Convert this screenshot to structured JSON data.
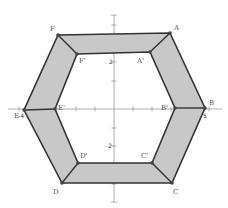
{
  "diagram": {
    "type": "geometry-figure",
    "colors": {
      "band_fill": "#c8c8c8",
      "edge": "#333333",
      "axis": "#9a9a9a",
      "label": "#555555"
    },
    "outer_hexagon": {
      "vertices": [
        {
          "name": "A",
          "label": "A",
          "x": 170,
          "y": 33,
          "lx": 174,
          "ly": 30
        },
        {
          "name": "B",
          "label": "B",
          "x": 205,
          "y": 108,
          "lx": 209,
          "ly": 105
        },
        {
          "name": "C",
          "label": "C",
          "x": 172,
          "y": 183,
          "lx": 173,
          "ly": 194
        },
        {
          "name": "D",
          "label": "D",
          "x": 62,
          "y": 183,
          "lx": 53,
          "ly": 194
        },
        {
          "name": "E",
          "label": "E",
          "x": 24,
          "y": 110,
          "lx": 14,
          "ly": 118
        },
        {
          "name": "F",
          "label": "F",
          "x": 58,
          "y": 35,
          "lx": 50,
          "ly": 31
        }
      ]
    },
    "inner_hexagon": {
      "vertices": [
        {
          "name": "A'",
          "label": "A'",
          "x": 150,
          "y": 52,
          "lx": 137,
          "ly": 63
        },
        {
          "name": "B'",
          "label": "B'",
          "x": 175,
          "y": 108,
          "lx": 161,
          "ly": 110
        },
        {
          "name": "C'",
          "label": "C'",
          "x": 152,
          "y": 163,
          "lx": 141,
          "ly": 158
        },
        {
          "name": "D'",
          "label": "D'",
          "x": 78,
          "y": 163,
          "lx": 80,
          "ly": 158
        },
        {
          "name": "E'",
          "label": "E'",
          "x": 55,
          "y": 109,
          "lx": 58,
          "ly": 110
        },
        {
          "name": "F'",
          "label": "F'",
          "x": 77,
          "y": 54,
          "lx": 79,
          "ly": 63
        }
      ]
    },
    "axes": {
      "origin": {
        "x": 114,
        "y": 109
      },
      "x_range_px": [
        8,
        222
      ],
      "y_range_px": [
        15,
        202
      ],
      "x_ticks_px": [
        19,
        37,
        56,
        76,
        95,
        133,
        152,
        171,
        190,
        209
      ],
      "y_ticks_px": [
        25,
        43,
        62,
        81,
        128,
        146,
        165,
        184
      ],
      "tick_labels": [
        {
          "text": "2",
          "x": 109,
          "y": 64
        },
        {
          "text": "-2",
          "x": 106,
          "y": 148
        },
        {
          "text": "-4",
          "x": 18,
          "y": 118
        },
        {
          "text": "5",
          "x": 203,
          "y": 118
        }
      ]
    }
  }
}
